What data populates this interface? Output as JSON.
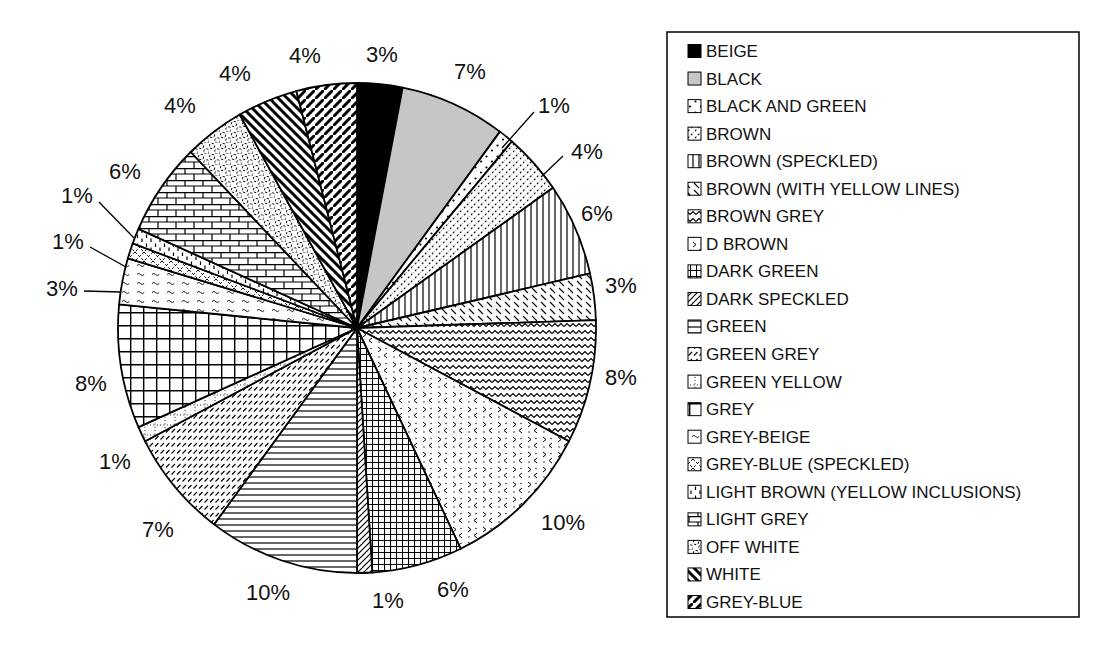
{
  "figure": {
    "kind": "scanned black-and-white pie chart figure",
    "background": "#ffffff"
  },
  "colors": {
    "ink": "#000000",
    "paper": "#ffffff",
    "gray_fill": "#c6c6c6"
  },
  "chart_data": {
    "type": "pie",
    "title": "",
    "direction": "clockwise",
    "start_angle_deg": 0,
    "legend_position": "right",
    "values_sum_shown": 98,
    "geometry": {
      "cx": 357,
      "cy": 328,
      "rx": 239,
      "ry": 245
    },
    "label_font_px": 22,
    "slices": [
      {
        "label": "BEIGE",
        "value": 3,
        "display": "3%",
        "pattern": "solid-black",
        "label_x": 382,
        "label_y": 55
      },
      {
        "label": "BLACK",
        "value": 7,
        "display": "7%",
        "pattern": "solid-gray",
        "label_x": 470,
        "label_y": 72
      },
      {
        "label": "BLACK AND GREEN",
        "value": 1,
        "display": "1%",
        "pattern": "sparse-dots",
        "label_x": 554,
        "label_y": 106,
        "leader": [
          [
            534,
            112
          ],
          [
            502,
            148
          ]
        ]
      },
      {
        "label": "BROWN",
        "value": 4,
        "display": "4%",
        "pattern": "diag-dotted",
        "label_x": 587,
        "label_y": 152,
        "leader": [
          [
            563,
            156
          ],
          [
            541,
            177
          ]
        ]
      },
      {
        "label": "BROWN (SPECKLED)",
        "value": 6,
        "display": "6%",
        "pattern": "vertical-lines",
        "label_x": 597,
        "label_y": 214
      },
      {
        "label": "BROWN (WITH YELLOW LINES)",
        "value": 3,
        "display": "3%",
        "pattern": "back-ticks",
        "label_x": 621,
        "label_y": 286
      },
      {
        "label": "BROWN GREY",
        "value": 8,
        "display": "8%",
        "pattern": "zigzag-wave",
        "label_x": 621,
        "label_y": 378
      },
      {
        "label": "D BROWN",
        "value": 10,
        "display": "10%",
        "pattern": "chevron-speckle",
        "label_x": 563,
        "label_y": 523
      },
      {
        "label": "DARK GREEN",
        "value": 6,
        "display": "6%",
        "pattern": "fine-grid",
        "label_x": 453,
        "label_y": 590
      },
      {
        "label": "DARK SPECKLED",
        "value": 1,
        "display": "1%",
        "pattern": "diag-up",
        "label_x": 388,
        "label_y": 601
      },
      {
        "label": "GREEN",
        "value": 10,
        "display": "10%",
        "pattern": "horizontal-lines",
        "label_x": 268,
        "label_y": 593
      },
      {
        "label": "GREEN GREY",
        "value": 7,
        "display": "7%",
        "pattern": "slash-dash-rows",
        "label_x": 158,
        "label_y": 530
      },
      {
        "label": "GREEN YELLOW",
        "value": 1,
        "display": "1%",
        "pattern": "dotted-grid",
        "label_x": 115,
        "label_y": 462
      },
      {
        "label": "GREY",
        "value": 8,
        "display": "8%",
        "pattern": "large-grid",
        "label_x": 91,
        "label_y": 384
      },
      {
        "label": "GREY-BEIGE",
        "value": 3,
        "display": "3%",
        "pattern": "tilde-rows",
        "label_x": 62,
        "label_y": 289,
        "leader": [
          [
            84,
            291
          ],
          [
            121,
            292
          ]
        ]
      },
      {
        "label": "GREY-BLUE (SPECKLED)",
        "value": 1,
        "display": "1%",
        "pattern": "diamond-mesh",
        "label_x": 68,
        "label_y": 242,
        "leader": [
          [
            90,
            247
          ],
          [
            126,
            267
          ]
        ]
      },
      {
        "label": "LIGHT BROWN (YELLOW INCLUSIONS)",
        "value": 1,
        "display": "1%",
        "pattern": "vertical-ticks",
        "label_x": 77,
        "label_y": 196,
        "leader": [
          [
            99,
            202
          ],
          [
            134,
            238
          ]
        ]
      },
      {
        "label": "LIGHT GREY",
        "value": 6,
        "display": "6%",
        "pattern": "brick",
        "label_x": 125,
        "label_y": 172
      },
      {
        "label": "OFF WHITE",
        "value": 4,
        "display": "4%",
        "pattern": "chain-circles",
        "label_x": 180,
        "label_y": 106
      },
      {
        "label": "WHITE",
        "value": 4,
        "display": "4%",
        "pattern": "thick-backslash",
        "label_x": 235,
        "label_y": 74
      },
      {
        "label": "GREY-BLUE",
        "value": 4,
        "display": "4%",
        "pattern": "thick-slash",
        "label_x": 305,
        "label_y": 56
      }
    ],
    "legend": {
      "box": {
        "x": 667,
        "y": 32,
        "w": 412,
        "h": 585
      },
      "swatch_px": 13,
      "row_height": 27.55,
      "font_px": 17
    }
  }
}
